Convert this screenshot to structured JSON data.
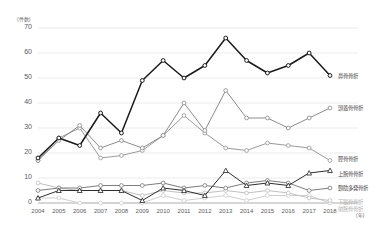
{
  "chart_data": {
    "type": "line",
    "title": "",
    "xlabel": "(年)",
    "ylabel": "(件数)",
    "ylim": [
      0,
      70
    ],
    "yticks": [
      0,
      10,
      20,
      30,
      40,
      50,
      60,
      70
    ],
    "grid": true,
    "legend_position": "right",
    "categories": [
      "2004",
      "2005",
      "2006",
      "2007",
      "2008",
      "2009",
      "2010",
      "2011",
      "2012",
      "2013",
      "2014",
      "2015",
      "2016",
      "2017",
      "2018"
    ],
    "series": [
      {
        "name": "鼻骨骨折",
        "color": "#1a1a1a",
        "marker": "circle",
        "values": [
          18,
          26,
          23,
          36,
          28,
          49,
          57,
          50,
          55,
          66,
          57,
          52,
          55,
          60,
          51
        ]
      },
      {
        "name": "頭蓋骨骨折",
        "color": "#8c8c8c",
        "marker": "circle",
        "values": [
          17,
          25,
          31,
          22,
          25,
          22,
          27,
          40,
          29,
          45,
          34,
          34,
          30,
          34,
          38
        ]
      },
      {
        "name": "脛骨骨折",
        "color": "#9a9a9a",
        "marker": "circle",
        "values": [
          17,
          26,
          30,
          18,
          19,
          21,
          27,
          35,
          28,
          22,
          21,
          24,
          23,
          22,
          17
        ]
      },
      {
        "name": "上腕骨骨折",
        "color": "#2e2e2e",
        "marker": "triangle",
        "values": [
          2,
          5,
          5,
          5,
          5,
          1,
          6,
          5,
          3,
          13,
          7,
          8,
          7,
          12,
          13
        ]
      },
      {
        "name": "頸肋多発骨折",
        "color": "#7d7d7d",
        "marker": "circle",
        "values": [
          5,
          6,
          6,
          7,
          7,
          7,
          8,
          6,
          7,
          6,
          8,
          9,
          8,
          5,
          6
        ]
      },
      {
        "name": "下腿骨骨折",
        "color": "#c0c0c0",
        "marker": "circle",
        "values": [
          8,
          6,
          5,
          5,
          5,
          3,
          5,
          4,
          4,
          5,
          4,
          5,
          4,
          2,
          1
        ]
      },
      {
        "name": "前腕骨骨折",
        "color": "#cfcfcf",
        "marker": "circle",
        "values": [
          2,
          2,
          0,
          0,
          0,
          0,
          3,
          1,
          2,
          3,
          1,
          3,
          3,
          3,
          0
        ]
      }
    ]
  },
  "axis": {
    "y_unit": "(件数)",
    "x_unit": "(年)"
  }
}
